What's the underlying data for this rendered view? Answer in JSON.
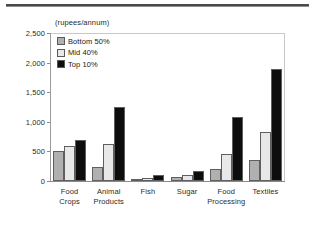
{
  "chart_data": {
    "type": "bar",
    "title": "",
    "subtitle": "",
    "unit_label": "(rupees/annum)",
    "xlabel": "",
    "ylabel": "",
    "ylim": [
      0,
      2500
    ],
    "yticks": [
      0,
      500,
      1000,
      1500,
      2000,
      2500
    ],
    "ytick_labels": [
      "0",
      "500",
      "1,000",
      "1,500",
      "2,000",
      "2,500"
    ],
    "grid": false,
    "legend_position": "top-left",
    "categories": [
      "Food Crops",
      "Animal Products",
      "Fish",
      "Sugar",
      "Food Processing",
      "Textiles"
    ],
    "category_lines": [
      [
        "Food",
        "Crops"
      ],
      [
        "Animal",
        "Products"
      ],
      [
        "Fish",
        ""
      ],
      [
        "Sugar",
        ""
      ],
      [
        "Food",
        "Processing"
      ],
      [
        "Textiles",
        ""
      ]
    ],
    "series": [
      {
        "name": "Bottom 50%",
        "color": "#b0b0b0",
        "values": [
          500,
          240,
          20,
          65,
          210,
          355
        ]
      },
      {
        "name": "Mid 40%",
        "color": "#e8e8e8",
        "values": [
          590,
          620,
          50,
          110,
          460,
          820
        ]
      },
      {
        "name": "Top 10%",
        "color": "#0d0d0d",
        "values": [
          690,
          1250,
          110,
          165,
          1080,
          1900
        ]
      }
    ]
  },
  "colors": {
    "bottom_50": "#b0b0b0",
    "mid_40": "#e8e8e8",
    "top_10": "#0d0d0d",
    "axis": "#8a8a8a",
    "text": "#2b2b2b",
    "rule": "#4a4a4a"
  }
}
